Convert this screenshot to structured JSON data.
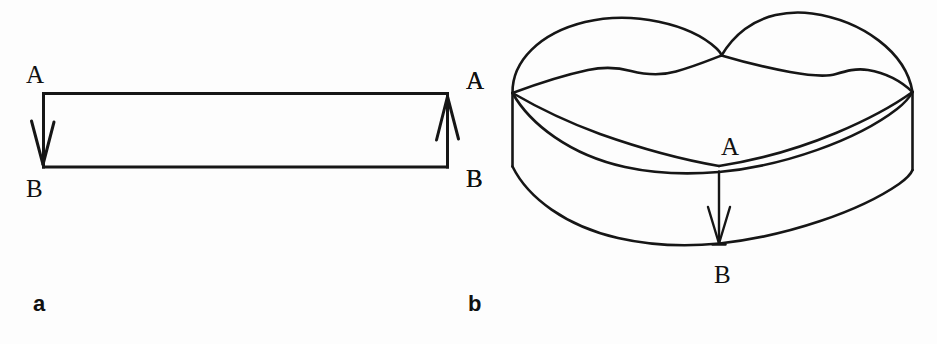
{
  "figure": {
    "background_color": "#fdfdfd",
    "stroke_color": "#161616",
    "panels": [
      {
        "id": "a",
        "caption": "a",
        "description": "rectangle-strip-with-identification-arrows",
        "labels": [
          {
            "name": "label-a-left-top",
            "text": "A"
          },
          {
            "name": "label-a-left-bottom",
            "text": "B"
          },
          {
            "name": "label-a-right-top",
            "text": "A"
          },
          {
            "name": "label-a-right-bottom",
            "text": "B"
          }
        ]
      },
      {
        "id": "b",
        "caption": "b",
        "description": "mobius-band-three-dimensional",
        "labels": [
          {
            "name": "label-b-left-top",
            "text": "A"
          },
          {
            "name": "label-b-left-bottom",
            "text": "B"
          },
          {
            "name": "label-b-center-top",
            "text": "A"
          },
          {
            "name": "label-b-center-bottom",
            "text": "B"
          }
        ]
      }
    ],
    "label_texts": {
      "A": "A",
      "B": "B",
      "panel_a": "a",
      "panel_b": "b"
    }
  }
}
